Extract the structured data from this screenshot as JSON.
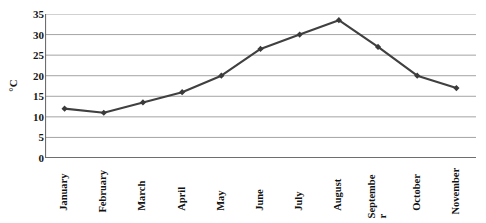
{
  "chart_data": {
    "type": "line",
    "title": "",
    "subtitle": "",
    "xlabel": "",
    "ylabel": "°C",
    "categories": [
      "January",
      "February",
      "March",
      "April",
      "May",
      "June",
      "July",
      "August",
      "September",
      "October",
      "November"
    ],
    "values": [
      12,
      11,
      13.5,
      16,
      20,
      26.5,
      30,
      33.5,
      27,
      20,
      17
    ],
    "series": [
      {
        "name": "Temperature",
        "values": [
          12,
          11,
          13.5,
          16,
          20,
          26.5,
          30,
          33.5,
          27,
          20,
          17
        ]
      }
    ],
    "ylim": [
      0,
      35
    ],
    "ytick_labels": [
      "0",
      "5",
      "10",
      "15",
      "20",
      "25",
      "30",
      "35"
    ],
    "ytick_values": [
      0,
      5,
      10,
      15,
      20,
      25,
      30,
      35
    ],
    "grid": "horizontal",
    "legend": "none",
    "marker": "diamond",
    "line_color": "#404040",
    "marker_color": "#3a3a3a",
    "grid_color": "#9a9a9a",
    "axis_color": "#6e6e6e",
    "background_color": "#ffffff",
    "x_label_rotation": -90,
    "y_label_rotation": -90,
    "x_labels_display": [
      "January",
      "February",
      "March",
      "April",
      "May",
      "June",
      "July",
      "August",
      "Septembe\nr",
      "October",
      "November"
    ]
  }
}
